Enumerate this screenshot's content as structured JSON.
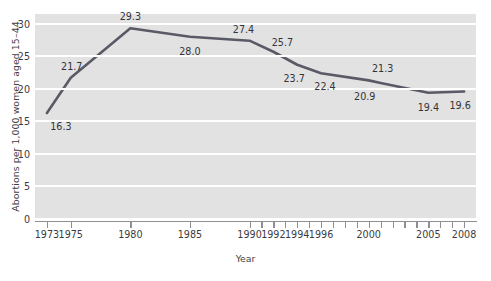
{
  "chart_data": {
    "type": "line",
    "title": "",
    "xlabel": "Year",
    "ylabel": "Abortions per 1,000 women aged 15–44",
    "xlim": [
      1972,
      2009
    ],
    "ylim": [
      0,
      31.5
    ],
    "grid": true,
    "legend": "none",
    "line_color": "#5a5a66",
    "plot_background": "#e2e2e2",
    "gridline_color": "#ffffff",
    "y_ticks": [
      0,
      5,
      10,
      15,
      20,
      25,
      30
    ],
    "y_tick_labels": [
      "0",
      "5",
      "10",
      "15",
      "20",
      "25",
      "30"
    ],
    "x_tick_labels": [
      "1973",
      "1975",
      "1980",
      "1985",
      "1990",
      "1992",
      "1994",
      "1996",
      "2000",
      "2005",
      "2008"
    ],
    "x_tick_positions": [
      1973,
      1975,
      1980,
      1985,
      1990,
      1992,
      1994,
      1996,
      2000,
      2005,
      2008
    ],
    "x_tick_marks": [
      1973,
      1975,
      1980,
      1985,
      1990,
      1991,
      1992,
      1993,
      1994,
      1995,
      1996,
      1997,
      1998,
      1999,
      2000,
      2001,
      2002,
      2003,
      2004,
      2005,
      2006,
      2007,
      2008
    ],
    "x": [
      1973,
      1975,
      1980,
      1985,
      1990,
      1992,
      1994,
      1996,
      2000,
      2001,
      2005,
      2008
    ],
    "values": [
      16.3,
      21.7,
      29.3,
      28.0,
      27.4,
      25.7,
      23.7,
      22.4,
      21.3,
      20.9,
      19.4,
      19.6
    ],
    "point_labels": [
      {
        "x": 1973,
        "value": 16.3,
        "text": "16.3",
        "dx": 14,
        "dy": 13
      },
      {
        "x": 1975,
        "value": 21.7,
        "text": "21.7",
        "dx": 1,
        "dy": -12
      },
      {
        "x": 1980,
        "value": 29.3,
        "text": "29.3",
        "dx": 0,
        "dy": -12
      },
      {
        "x": 1985,
        "value": 28.0,
        "text": "28.0",
        "dx": 0,
        "dy": 14
      },
      {
        "x": 1990,
        "value": 27.4,
        "text": "27.4",
        "dx": -6,
        "dy": -12
      },
      {
        "x": 1992,
        "value": 25.7,
        "text": "25.7",
        "dx": 9,
        "dy": -10
      },
      {
        "x": 1994,
        "value": 23.7,
        "text": "23.7",
        "dx": -3,
        "dy": 13
      },
      {
        "x": 1996,
        "value": 22.4,
        "text": "22.4",
        "dx": 4,
        "dy": 13
      },
      {
        "x": 2001,
        "value": 21.3,
        "text": "21.3",
        "dx": 2,
        "dy": -12
      },
      {
        "x": 2000,
        "value": 20.9,
        "text": "20.9",
        "dx": -4,
        "dy": 13
      },
      {
        "x": 2005,
        "value": 19.4,
        "text": "19.4",
        "dx": 0,
        "dy": 14
      },
      {
        "x": 2008,
        "value": 19.6,
        "text": "19.6",
        "dx": -4,
        "dy": 14
      }
    ]
  }
}
